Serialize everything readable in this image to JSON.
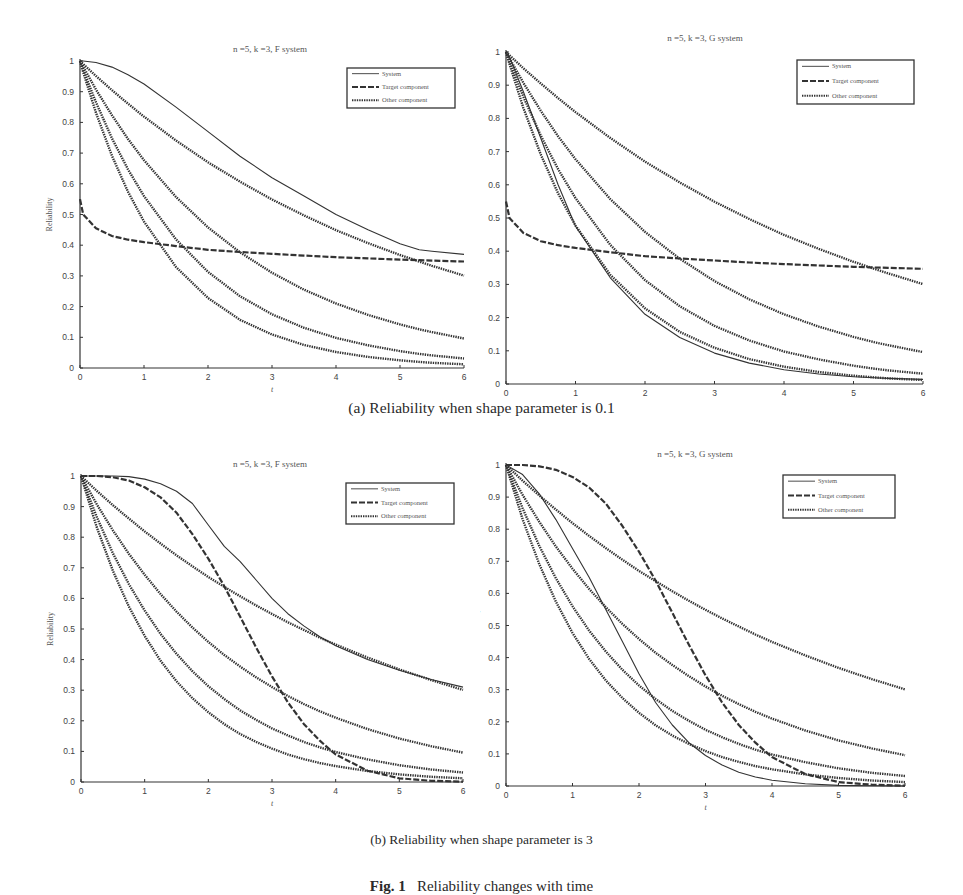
{
  "figure": {
    "caption_a": "(a) Reliability when shape parameter is 0.1",
    "caption_b": "(b) Reliability when shape parameter is 3",
    "fig_label": "Fig. 1",
    "fig_caption": "Reliability changes with time"
  },
  "legend": {
    "system": "System",
    "target": "Target component",
    "other": "Other component"
  },
  "colors": {
    "line": "#333333",
    "axis": "#333333",
    "text": "#444444"
  },
  "chart_data": [
    {
      "id": "a-left",
      "type": "line",
      "title": "n =5,   k =3, F system",
      "xlabel": "t",
      "ylabel": "Reliability",
      "xlim": [
        0,
        6
      ],
      "ylim": [
        0,
        1
      ],
      "xticks": [
        0,
        1,
        2,
        3,
        4,
        5,
        6
      ],
      "yticks": [
        0,
        0.1,
        0.2,
        0.3,
        0.4,
        0.5,
        0.6,
        0.7,
        0.8,
        0.9,
        1
      ],
      "ytick_labels": [
        "0",
        "0.1",
        "0.2",
        "0.3",
        "0.4",
        "0.5",
        "0.6",
        "0.7",
        "0.8",
        "0.9",
        "1"
      ],
      "grid": false,
      "legend_position": "upper right",
      "x": [
        0,
        0.05,
        0.25,
        0.5,
        0.75,
        1,
        1.5,
        2,
        2.5,
        3,
        3.5,
        4,
        4.5,
        5,
        5.3,
        5.5,
        6
      ],
      "series": [
        {
          "name": "System",
          "style": "solid",
          "values": [
            1.0,
            1.0,
            0.995,
            0.98,
            0.955,
            0.925,
            0.85,
            0.77,
            0.69,
            0.62,
            0.56,
            0.5,
            0.45,
            0.405,
            0.385,
            0.38,
            0.37
          ]
        },
        {
          "name": "Target component",
          "style": "dashed",
          "values": [
            0.55,
            0.5,
            0.455,
            0.43,
            0.418,
            0.41,
            0.397,
            0.385,
            0.378,
            0.372,
            0.366,
            0.361,
            0.357,
            0.353,
            0.351,
            0.35,
            0.347
          ]
        },
        {
          "name": "Other component 1",
          "style": "dotted",
          "values": [
            1.0,
            0.99,
            0.951,
            0.905,
            0.861,
            0.819,
            0.741,
            0.67,
            0.607,
            0.549,
            0.497,
            0.449,
            0.407,
            0.368,
            0.347,
            0.333,
            0.301
          ]
        },
        {
          "name": "Other component 2",
          "style": "dotted",
          "values": [
            1.0,
            0.981,
            0.907,
            0.823,
            0.746,
            0.677,
            0.557,
            0.458,
            0.377,
            0.31,
            0.255,
            0.21,
            0.173,
            0.142,
            0.126,
            0.117,
            0.096
          ]
        },
        {
          "name": "Other component 3",
          "style": "dotted",
          "values": [
            1.0,
            0.971,
            0.865,
            0.748,
            0.647,
            0.56,
            0.419,
            0.313,
            0.234,
            0.175,
            0.131,
            0.098,
            0.074,
            0.055,
            0.046,
            0.041,
            0.031
          ]
        },
        {
          "name": "Other component 4",
          "style": "dotted",
          "values": [
            1.0,
            0.964,
            0.831,
            0.691,
            0.574,
            0.477,
            0.329,
            0.228,
            0.157,
            0.109,
            0.075,
            0.052,
            0.036,
            0.025,
            0.02,
            0.017,
            0.012
          ]
        }
      ]
    },
    {
      "id": "a-right",
      "type": "line",
      "title": "n =5,   k =3, G system",
      "xlabel": "t",
      "ylabel": "Reliability",
      "xlim": [
        0,
        6
      ],
      "ylim": [
        0,
        1
      ],
      "xticks": [
        0,
        1,
        2,
        3,
        4,
        5,
        6
      ],
      "yticks": [
        0,
        0.1,
        0.2,
        0.3,
        0.4,
        0.5,
        0.6,
        0.7,
        0.8,
        0.9,
        1
      ],
      "ytick_labels": [
        "0",
        "0.1",
        "0.2",
        "0.3",
        "0.4",
        "0.5",
        "0.6",
        "0.7",
        "0.8",
        "0.9",
        "1"
      ],
      "grid": false,
      "legend_position": "upper right",
      "x": [
        0,
        0.05,
        0.25,
        0.5,
        0.75,
        1,
        1.5,
        2,
        2.5,
        3,
        3.5,
        4,
        4.5,
        5,
        5.3,
        5.5,
        6
      ],
      "series": [
        {
          "name": "System",
          "style": "solid",
          "values": [
            1.0,
            0.985,
            0.88,
            0.74,
            0.6,
            0.475,
            0.32,
            0.21,
            0.14,
            0.093,
            0.063,
            0.043,
            0.03,
            0.022,
            0.019,
            0.017,
            0.014
          ]
        },
        {
          "name": "Target component",
          "style": "dashed",
          "values": [
            0.55,
            0.5,
            0.455,
            0.43,
            0.418,
            0.41,
            0.397,
            0.385,
            0.378,
            0.372,
            0.366,
            0.361,
            0.357,
            0.353,
            0.351,
            0.35,
            0.347
          ]
        },
        {
          "name": "Other component 1",
          "style": "dotted",
          "values": [
            1.0,
            0.99,
            0.951,
            0.905,
            0.861,
            0.819,
            0.741,
            0.67,
            0.607,
            0.549,
            0.497,
            0.449,
            0.407,
            0.368,
            0.347,
            0.333,
            0.301
          ]
        },
        {
          "name": "Other component 2",
          "style": "dotted",
          "values": [
            1.0,
            0.981,
            0.907,
            0.823,
            0.746,
            0.677,
            0.557,
            0.458,
            0.377,
            0.31,
            0.255,
            0.21,
            0.173,
            0.142,
            0.126,
            0.117,
            0.096
          ]
        },
        {
          "name": "Other component 3",
          "style": "dotted",
          "values": [
            1.0,
            0.971,
            0.865,
            0.748,
            0.647,
            0.56,
            0.419,
            0.313,
            0.234,
            0.175,
            0.131,
            0.098,
            0.074,
            0.055,
            0.046,
            0.041,
            0.031
          ]
        },
        {
          "name": "Other component 4",
          "style": "dotted",
          "values": [
            1.0,
            0.964,
            0.831,
            0.691,
            0.574,
            0.477,
            0.329,
            0.228,
            0.157,
            0.109,
            0.075,
            0.052,
            0.036,
            0.025,
            0.02,
            0.017,
            0.012
          ]
        }
      ]
    },
    {
      "id": "b-left",
      "type": "line",
      "title": "n =5,   k =3, F system",
      "xlabel": "t",
      "ylabel": "Reliability",
      "xlim": [
        0,
        6
      ],
      "ylim": [
        0,
        1
      ],
      "xticks": [
        0,
        1,
        2,
        3,
        4,
        5,
        6
      ],
      "yticks": [
        0,
        0.1,
        0.2,
        0.3,
        0.4,
        0.5,
        0.6,
        0.7,
        0.8,
        0.9,
        1
      ],
      "ytick_labels": [
        "0",
        "0.1",
        "0.2",
        "0.3",
        "0.4",
        "0.5",
        "0.6",
        "0.7",
        "0.8",
        "0.9",
        "1"
      ],
      "grid": false,
      "legend_position": "upper right",
      "x": [
        0,
        0.25,
        0.5,
        0.75,
        1,
        1.25,
        1.5,
        1.75,
        2,
        2.25,
        2.5,
        2.75,
        3,
        3.25,
        3.5,
        3.75,
        4,
        4.5,
        5,
        5.5,
        6
      ],
      "series": [
        {
          "name": "System",
          "style": "solid",
          "values": [
            1.0,
            1.0,
            1.0,
            0.998,
            0.99,
            0.975,
            0.95,
            0.91,
            0.84,
            0.77,
            0.72,
            0.66,
            0.6,
            0.55,
            0.51,
            0.475,
            0.445,
            0.4,
            0.365,
            0.335,
            0.31
          ]
        },
        {
          "name": "Target component",
          "style": "dashed",
          "values": [
            1.0,
            1.0,
            0.996,
            0.985,
            0.963,
            0.93,
            0.88,
            0.81,
            0.73,
            0.64,
            0.54,
            0.44,
            0.345,
            0.26,
            0.19,
            0.135,
            0.09,
            0.037,
            0.012,
            0.004,
            0.001
          ]
        },
        {
          "name": "Other component 1",
          "style": "dotted",
          "values": [
            1.0,
            0.951,
            0.905,
            0.861,
            0.819,
            0.779,
            0.741,
            0.705,
            0.67,
            0.638,
            0.607,
            0.577,
            0.549,
            0.522,
            0.497,
            0.472,
            0.449,
            0.407,
            0.368,
            0.333,
            0.301
          ]
        },
        {
          "name": "Other component 2",
          "style": "dotted",
          "values": [
            1.0,
            0.907,
            0.823,
            0.746,
            0.677,
            0.614,
            0.557,
            0.505,
            0.458,
            0.415,
            0.377,
            0.342,
            0.31,
            0.281,
            0.255,
            0.231,
            0.21,
            0.173,
            0.142,
            0.117,
            0.096
          ]
        },
        {
          "name": "Other component 3",
          "style": "dotted",
          "values": [
            1.0,
            0.865,
            0.748,
            0.647,
            0.56,
            0.484,
            0.419,
            0.362,
            0.313,
            0.271,
            0.234,
            0.203,
            0.175,
            0.152,
            0.131,
            0.113,
            0.098,
            0.074,
            0.055,
            0.041,
            0.031
          ]
        },
        {
          "name": "Other component 4",
          "style": "dotted",
          "values": [
            1.0,
            0.831,
            0.691,
            0.574,
            0.477,
            0.396,
            0.329,
            0.274,
            0.228,
            0.189,
            0.157,
            0.131,
            0.109,
            0.09,
            0.075,
            0.062,
            0.052,
            0.036,
            0.025,
            0.017,
            0.012
          ]
        }
      ]
    },
    {
      "id": "b-right",
      "type": "line",
      "title": "n =5,   k =3, G system",
      "xlabel": "t",
      "ylabel": "Reliability",
      "xlim": [
        0,
        6
      ],
      "ylim": [
        0,
        1
      ],
      "xticks": [
        0,
        1,
        2,
        3,
        4,
        5,
        6
      ],
      "yticks": [
        0,
        0.1,
        0.2,
        0.3,
        0.4,
        0.5,
        0.6,
        0.7,
        0.8,
        0.9,
        1
      ],
      "ytick_labels": [
        "0",
        "0.1",
        "0.2",
        "0.3",
        "0.4",
        "0.5",
        "0.6",
        "0.7",
        "0.8",
        "0.9",
        "1"
      ],
      "grid": false,
      "legend_position": "upper right",
      "x": [
        0,
        0.25,
        0.5,
        0.75,
        1,
        1.25,
        1.5,
        1.75,
        2,
        2.25,
        2.5,
        2.75,
        3,
        3.25,
        3.5,
        3.75,
        4,
        4.5,
        5,
        5.5,
        6
      ],
      "series": [
        {
          "name": "System",
          "style": "solid",
          "values": [
            1.0,
            0.97,
            0.91,
            0.83,
            0.74,
            0.65,
            0.55,
            0.45,
            0.35,
            0.26,
            0.19,
            0.135,
            0.095,
            0.065,
            0.043,
            0.028,
            0.018,
            0.007,
            0.002,
            0.001,
            0.0
          ]
        },
        {
          "name": "Target component",
          "style": "dashed",
          "values": [
            1.0,
            1.0,
            0.996,
            0.985,
            0.963,
            0.93,
            0.88,
            0.81,
            0.73,
            0.64,
            0.54,
            0.44,
            0.345,
            0.26,
            0.19,
            0.135,
            0.09,
            0.037,
            0.012,
            0.004,
            0.001
          ]
        },
        {
          "name": "Other component 1",
          "style": "dotted",
          "values": [
            1.0,
            0.951,
            0.905,
            0.861,
            0.819,
            0.779,
            0.741,
            0.705,
            0.67,
            0.638,
            0.607,
            0.577,
            0.549,
            0.522,
            0.497,
            0.472,
            0.449,
            0.407,
            0.368,
            0.333,
            0.301
          ]
        },
        {
          "name": "Other component 2",
          "style": "dotted",
          "values": [
            1.0,
            0.907,
            0.823,
            0.746,
            0.677,
            0.614,
            0.557,
            0.505,
            0.458,
            0.415,
            0.377,
            0.342,
            0.31,
            0.281,
            0.255,
            0.231,
            0.21,
            0.173,
            0.142,
            0.117,
            0.096
          ]
        },
        {
          "name": "Other component 3",
          "style": "dotted",
          "values": [
            1.0,
            0.865,
            0.748,
            0.647,
            0.56,
            0.484,
            0.419,
            0.362,
            0.313,
            0.271,
            0.234,
            0.203,
            0.175,
            0.152,
            0.131,
            0.113,
            0.098,
            0.074,
            0.055,
            0.041,
            0.031
          ]
        },
        {
          "name": "Other component 4",
          "style": "dotted",
          "values": [
            1.0,
            0.831,
            0.691,
            0.574,
            0.477,
            0.396,
            0.329,
            0.274,
            0.228,
            0.189,
            0.157,
            0.131,
            0.109,
            0.09,
            0.075,
            0.062,
            0.052,
            0.036,
            0.025,
            0.017,
            0.012
          ]
        }
      ]
    }
  ]
}
